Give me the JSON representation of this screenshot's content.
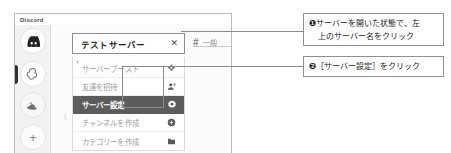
{
  "app": {
    "brand": "Discord",
    "server_header": {
      "name": "テストサーバー",
      "close_icon": "close-icon"
    },
    "channel": {
      "hash": "#",
      "name": "一般"
    },
    "rail": {
      "logo_icon": "discord-logo-icon",
      "server_1_icon": "server-avatar-icon",
      "server_2_icon": "server-avatar-icon",
      "add_server_label": "+"
    },
    "menu": {
      "caret": "▾",
      "items": [
        {
          "label": "サーバーブースト",
          "icon": "boost-icon",
          "selected": false
        },
        {
          "label": "友達を招待",
          "icon": "invite-icon",
          "selected": false
        },
        {
          "label": "サーバー設定",
          "icon": "gear-icon",
          "selected": true
        },
        {
          "label": "チャンネルを作成",
          "icon": "plus-circle-icon",
          "selected": false
        },
        {
          "label": "カテゴリーを作成",
          "icon": "folder-icon",
          "selected": false
        }
      ]
    }
  },
  "annotations": [
    {
      "marker": "❶",
      "line_1": "サーバーを開いた状態で、左",
      "line_2": "上のサーバー名をクリック"
    },
    {
      "marker": "❷",
      "line_1": "［サーバー設定］をクリック"
    }
  ],
  "colors": {
    "selected_row_bg": "#5c5c5c",
    "frame_border": "#b9b9b9",
    "callout_border": "#8f8f8f",
    "leader_line": "#8a8a8a"
  }
}
